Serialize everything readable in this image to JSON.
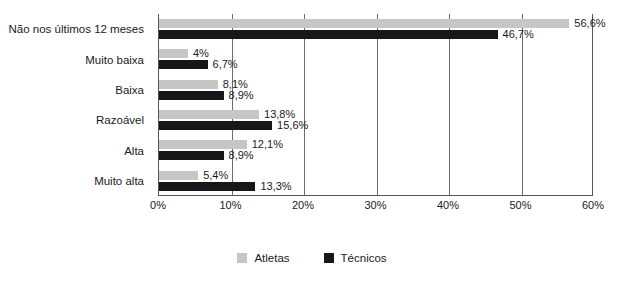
{
  "chart_data": {
    "type": "bar",
    "orientation": "horizontal",
    "title": "",
    "subtitle": "",
    "xlabel": "",
    "ylabel": "",
    "xlim": [
      0,
      60
    ],
    "xticks": [
      "0%",
      "10%",
      "20%",
      "30%",
      "40%",
      "50%",
      "60%"
    ],
    "xtick_values": [
      0,
      10,
      20,
      30,
      40,
      50,
      60
    ],
    "grid": true,
    "grid_axis": "x",
    "legend_position": "bottom",
    "categories": [
      "Não nos últimos 12 meses",
      "Muito baixa",
      "Baixa",
      "Razoável",
      "Alta",
      "Muito alta"
    ],
    "series": [
      {
        "name": "Atletas",
        "color": "#c6c6c6",
        "values": [
          56.6,
          4,
          8.1,
          13.8,
          12.1,
          5.4
        ],
        "labels": [
          "56,6%",
          "4%",
          "8,1%",
          "13,8%",
          "12,1%",
          "5,4%"
        ]
      },
      {
        "name": "Técnicos",
        "color": "#17171a",
        "values": [
          46.7,
          6.7,
          8.9,
          15.6,
          8.9,
          13.3
        ],
        "labels": [
          "46,7%",
          "6,7%",
          "8,9%",
          "15,6%",
          "8,9%",
          "13,3%"
        ]
      }
    ]
  },
  "legend": {
    "items": [
      {
        "label": "Atletas",
        "color": "#c6c6c6",
        "swatch_name": "legend-swatch-atletas"
      },
      {
        "label": "Técnicos",
        "color": "#17171a",
        "swatch_name": "legend-swatch-tecnicos"
      }
    ]
  }
}
